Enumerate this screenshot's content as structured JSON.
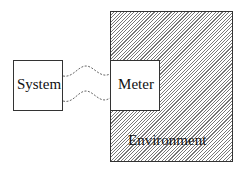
{
  "diagram": {
    "nodes": [
      {
        "id": "system",
        "label": "System"
      },
      {
        "id": "meter",
        "label": "Meter"
      },
      {
        "id": "environment",
        "label": "Environment"
      }
    ],
    "edges": [
      {
        "from": "system",
        "to": "meter",
        "style": "dashed-wavy"
      },
      {
        "from": "system",
        "to": "meter",
        "style": "dashed-wavy"
      }
    ],
    "environment_fill": "diagonal-hatch"
  }
}
